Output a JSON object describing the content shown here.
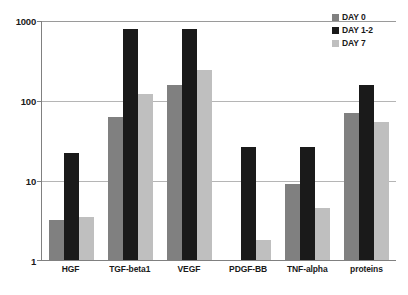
{
  "chart_data": {
    "type": "bar",
    "title": "",
    "xlabel": "",
    "ylabel": "",
    "yscale": "log",
    "ylim": [
      1,
      1000
    ],
    "ytick_labels": [
      "1",
      "10",
      "100",
      "1000"
    ],
    "ytick_values": [
      1,
      10,
      100,
      1000
    ],
    "grid": true,
    "legend_position": "top-right",
    "categories": [
      "HGF",
      "TGF-beta1",
      "VEGF",
      "PDGF-BB",
      "TNF-alpha",
      "proteins"
    ],
    "series": [
      {
        "name": "DAY 0",
        "color": "#808080",
        "values": [
          3.2,
          62,
          155,
          null,
          9.0,
          68
        ]
      },
      {
        "name": "DAY 1-2",
        "color": "#1a1a1a",
        "values": [
          22,
          780,
          780,
          26,
          26,
          155
        ]
      },
      {
        "name": "DAY 7",
        "color": "#bfbfbf",
        "values": [
          3.4,
          118,
          240,
          1.8,
          4.5,
          53
        ]
      }
    ]
  },
  "legend": {
    "items": [
      {
        "label": "DAY 0",
        "color": "#808080"
      },
      {
        "label": "DAY 1-2",
        "color": "#1a1a1a"
      },
      {
        "label": "DAY 7",
        "color": "#bfbfbf"
      }
    ]
  },
  "axis": {
    "y_labels": [
      "1000",
      "100",
      "10",
      "1"
    ],
    "x_labels": [
      "HGF",
      "TGF-beta1",
      "VEGF",
      "PDGF-BB",
      "TNF-alpha",
      "proteins"
    ]
  }
}
